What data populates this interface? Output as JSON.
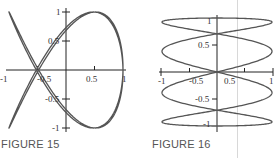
{
  "chart_data": [
    {
      "type": "line",
      "title": "FIGURE 15",
      "curve": "Lissajous parametric curve",
      "param": {
        "x": "sin(2t + 0.5)",
        "y": "cos(3t)",
        "t_range": [
          0,
          6.2832
        ]
      },
      "xlim": [
        -1,
        1
      ],
      "ylim": [
        -1,
        1
      ],
      "x_ticks": [
        "-1",
        "-0.5",
        "0.5",
        "1"
      ],
      "y_ticks": [
        "1",
        "0.5",
        "-0.5",
        "-1"
      ],
      "grid": false,
      "color": "#555555"
    },
    {
      "type": "line",
      "title": "FIGURE 16",
      "curve": "parametric zigzag curve",
      "param": {
        "x": "sin(4t)",
        "y": "cos(t)",
        "t_range": [
          0,
          6.2832
        ]
      },
      "xlim": [
        -1,
        1
      ],
      "ylim": [
        -1,
        1
      ],
      "x_ticks": [
        "-1",
        "-0.5",
        "0.5",
        "1"
      ],
      "y_ticks": [
        "1",
        "0.5",
        "-0.5",
        "-1"
      ],
      "grid": false,
      "color": "#555555"
    }
  ],
  "figures": {
    "fig15": {
      "caption": "FIGURE 15",
      "x_labels": {
        "neg1": "-1",
        "neg05": "-0.5",
        "pos05": "0.5",
        "pos1": "1"
      },
      "y_labels": {
        "pos1": "1",
        "pos05": "0.5",
        "neg05": "-0.5",
        "neg1": "-1"
      }
    },
    "fig16": {
      "caption": "FIGURE 16",
      "x_labels": {
        "neg1": "-1",
        "neg05": "-0.5",
        "pos05": "0.5",
        "pos1": "1"
      },
      "y_labels": {
        "pos1": "1",
        "pos05": "0.5",
        "neg05": "-0.5",
        "neg1": "-1"
      }
    }
  }
}
